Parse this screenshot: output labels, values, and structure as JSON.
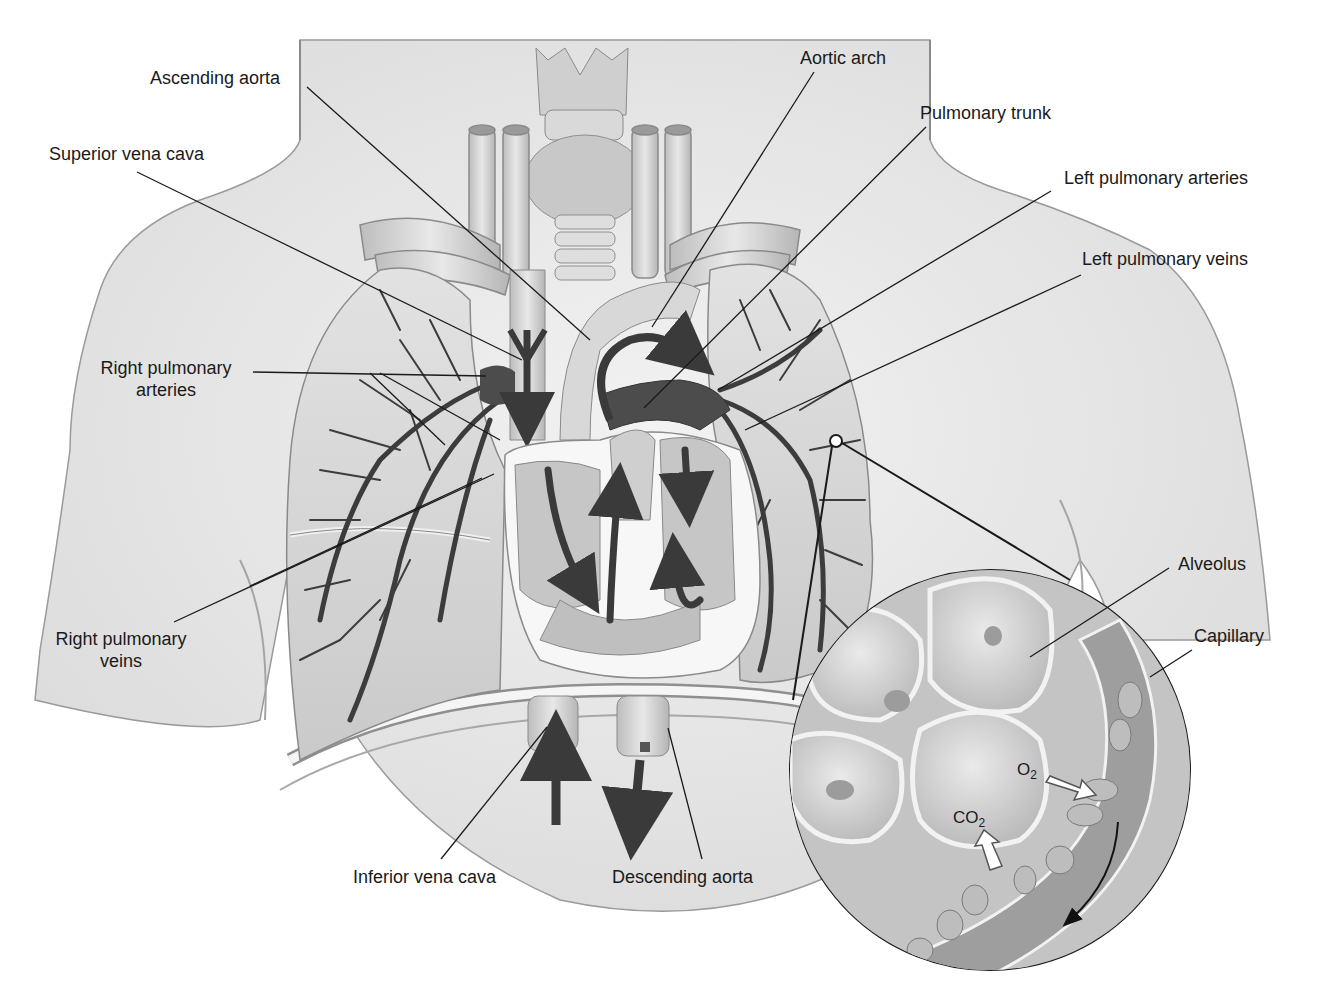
{
  "figure": {
    "palette": {
      "ink": "#1a1a1a",
      "skin": "#e6e6e6",
      "lung": "#d2d2d2",
      "vessel_dark": "#4a4a4a",
      "vessel_light": "#cfcfcf",
      "background": "#ffffff"
    }
  },
  "labels": {
    "ascending_aorta": "Ascending aorta",
    "aortic_arch": "Aortic arch",
    "pulmonary_trunk": "Pulmonary trunk",
    "superior_vena_cava": "Superior vena cava",
    "left_pulmonary_arteries": "Left pulmonary arteries",
    "left_pulmonary_veins": "Left pulmonary veins",
    "right_pulmonary_arteries_l1": "Right pulmonary",
    "right_pulmonary_arteries_l2": "arteries",
    "right_pulmonary_veins_l1": "Right pulmonary",
    "right_pulmonary_veins_l2": "veins",
    "inferior_vena_cava": "Inferior vena cava",
    "descending_aorta": "Descending aorta",
    "alveolus": "Alveolus",
    "capillary": "Capillary"
  },
  "inset": {
    "o2": {
      "symbol": "O",
      "subscript": "2"
    },
    "co2": {
      "symbol": "CO",
      "subscript": "2"
    }
  }
}
